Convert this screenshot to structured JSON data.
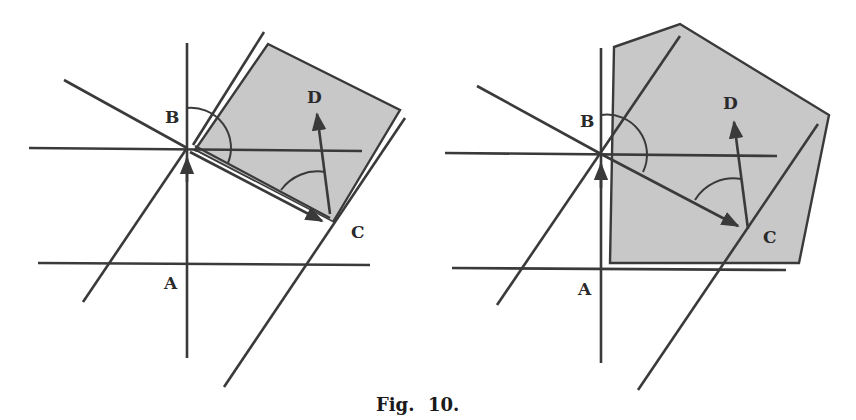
{
  "figure": {
    "caption_prefix": "Fig.",
    "caption_number": "10.",
    "colors": {
      "line": "#3a3a3a",
      "region_fill": "#c8c8c8",
      "background": "#ffffff"
    }
  },
  "panels": [
    {
      "id": "left",
      "region_shape": "quadrilateral",
      "labels": {
        "A": "A",
        "B": "B",
        "C": "C",
        "D": "D"
      }
    },
    {
      "id": "right",
      "region_shape": "pentagon",
      "labels": {
        "A": "A",
        "B": "B",
        "C": "C",
        "D": "D"
      }
    }
  ]
}
